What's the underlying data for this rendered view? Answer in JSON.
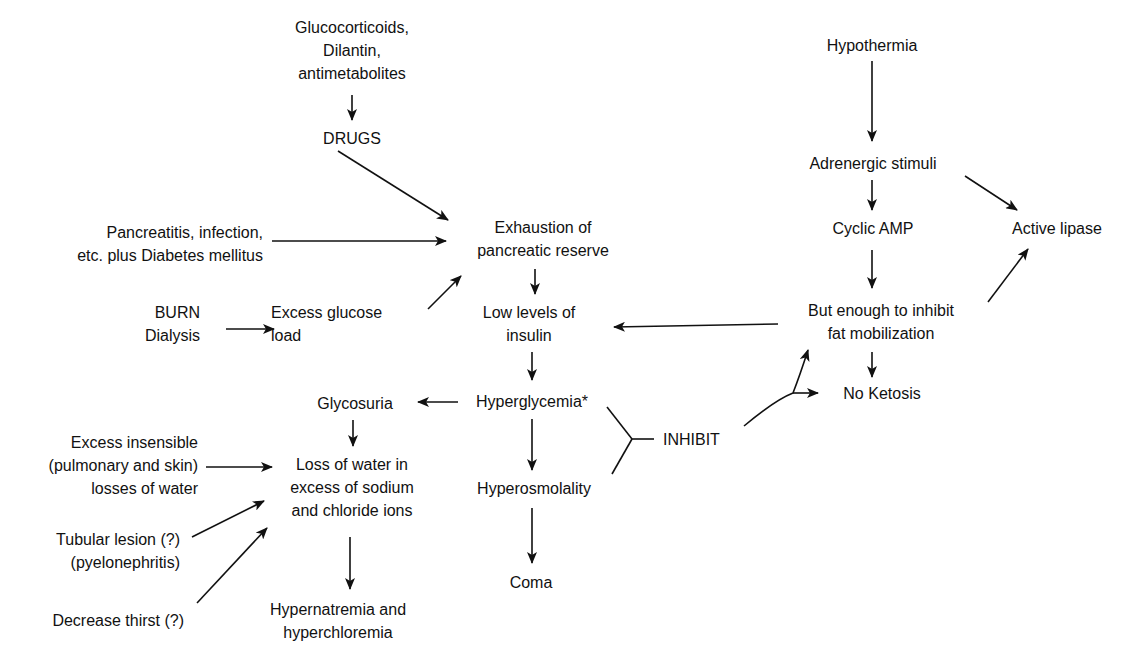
{
  "diagram": {
    "colors": {
      "ink": "#111111",
      "background": "#ffffff"
    },
    "nodes": [
      {
        "id": "drug_list",
        "align": "c",
        "x": 352,
        "y": 16,
        "lines": [
          "Glucocorticoids,",
          "Dilantin,",
          "antimetabolites"
        ]
      },
      {
        "id": "drugs",
        "align": "c",
        "x": 352,
        "y": 127,
        "lines": [
          "DRUGS"
        ]
      },
      {
        "id": "pancreatitis",
        "align": "r",
        "x": 263,
        "y": 221,
        "lines": [
          "Pancreatitis, infection,",
          "etc. plus Diabetes mellitus"
        ]
      },
      {
        "id": "exhaustion",
        "align": "c",
        "x": 543,
        "y": 216,
        "lines": [
          "Exhaustion of",
          "pancreatic reserve"
        ]
      },
      {
        "id": "burn",
        "align": "r",
        "x": 200,
        "y": 301,
        "lines": [
          "BURN",
          "Dialysis"
        ]
      },
      {
        "id": "excess_glucose",
        "align": "l",
        "x": 271,
        "y": 301,
        "lines": [
          "Excess glucose",
          "load"
        ]
      },
      {
        "id": "low_insulin",
        "align": "c",
        "x": 529,
        "y": 301,
        "lines": [
          "Low levels of",
          "insulin"
        ]
      },
      {
        "id": "glycosuria",
        "align": "c",
        "x": 355,
        "y": 392,
        "lines": [
          "Glycosuria"
        ]
      },
      {
        "id": "hyperglycemia",
        "align": "c",
        "x": 532,
        "y": 390,
        "lines": [
          "Hyperglycemia*"
        ]
      },
      {
        "id": "excess_insensible",
        "align": "r",
        "x": 198,
        "y": 431,
        "lines": [
          "Excess insensible",
          "(pulmonary and skin)",
          "losses of water"
        ]
      },
      {
        "id": "loss_water",
        "align": "c",
        "x": 352,
        "y": 453,
        "lines": [
          "Loss of water in",
          "excess of sodium",
          "and chloride ions"
        ]
      },
      {
        "id": "hyperosmolality",
        "align": "c",
        "x": 534,
        "y": 477,
        "lines": [
          "Hyperosmolality"
        ]
      },
      {
        "id": "tubular",
        "align": "r",
        "x": 180,
        "y": 528,
        "lines": [
          "Tubular lesion (?)",
          "(pyelonephritis)"
        ]
      },
      {
        "id": "coma",
        "align": "c",
        "x": 531,
        "y": 571,
        "lines": [
          "Coma"
        ]
      },
      {
        "id": "thirst",
        "align": "r",
        "x": 184,
        "y": 609,
        "lines": [
          "Decrease thirst (?)"
        ]
      },
      {
        "id": "hypernatremia",
        "align": "c",
        "x": 338,
        "y": 598,
        "lines": [
          "Hypernatremia and",
          "hyperchloremia"
        ]
      },
      {
        "id": "inhibit",
        "align": "l",
        "x": 663,
        "y": 428,
        "lines": [
          "INHIBIT"
        ]
      },
      {
        "id": "hypothermia",
        "align": "c",
        "x": 872,
        "y": 34,
        "lines": [
          "Hypothermia"
        ]
      },
      {
        "id": "adrenergic",
        "align": "c",
        "x": 873,
        "y": 152,
        "lines": [
          "Adrenergic stimuli"
        ]
      },
      {
        "id": "cyclic_amp",
        "align": "c",
        "x": 873,
        "y": 217,
        "lines": [
          "Cyclic AMP"
        ]
      },
      {
        "id": "active_lipase",
        "align": "c",
        "x": 1057,
        "y": 217,
        "lines": [
          "Active lipase"
        ]
      },
      {
        "id": "but_enough",
        "align": "c",
        "x": 881,
        "y": 299,
        "lines": [
          "But enough to inhibit",
          "fat mobilization"
        ]
      },
      {
        "id": "no_ketosis",
        "align": "c",
        "x": 882,
        "y": 382,
        "lines": [
          "No Ketosis"
        ]
      }
    ],
    "arrows": [
      {
        "from": "drug_list",
        "to": "drugs",
        "x1": 352,
        "y1": 95,
        "x2": 352,
        "y2": 120,
        "head": true
      },
      {
        "from": "drugs",
        "to": "exhaustion",
        "x1": 338,
        "y1": 151,
        "x2": 448,
        "y2": 220,
        "head": true
      },
      {
        "from": "pancreatitis",
        "to": "exhaustion",
        "x1": 272,
        "y1": 241,
        "x2": 446,
        "y2": 241,
        "head": true
      },
      {
        "from": "burn",
        "to": "excess_glucose",
        "x1": 226,
        "y1": 329,
        "x2": 274,
        "y2": 329,
        "head": true
      },
      {
        "from": "excess_glucose",
        "to": "exhaustion",
        "x1": 428,
        "y1": 309,
        "x2": 461,
        "y2": 276,
        "head": true
      },
      {
        "from": "exhaustion",
        "to": "low_insulin",
        "x1": 535,
        "y1": 269,
        "x2": 535,
        "y2": 294,
        "head": true
      },
      {
        "from": "but_enough",
        "to": "low_insulin",
        "x1": 778,
        "y1": 324,
        "x2": 614,
        "y2": 327,
        "head": true
      },
      {
        "from": "low_insulin",
        "to": "hyperglycemia",
        "x1": 532,
        "y1": 352,
        "x2": 532,
        "y2": 380,
        "head": true
      },
      {
        "from": "hyperglycemia",
        "to": "glycosuria",
        "x1": 458,
        "y1": 402,
        "x2": 418,
        "y2": 402,
        "head": true
      },
      {
        "from": "glycosuria",
        "to": "loss_water",
        "x1": 353,
        "y1": 420,
        "x2": 353,
        "y2": 446,
        "head": true
      },
      {
        "from": "hyperglycemia",
        "to": "hyperosmolality",
        "x1": 532,
        "y1": 419,
        "x2": 532,
        "y2": 470,
        "head": true
      },
      {
        "from": "excess_insensible",
        "to": "loss_water",
        "x1": 206,
        "y1": 467,
        "x2": 272,
        "y2": 467,
        "head": true
      },
      {
        "from": "tubular",
        "to": "loss_water",
        "x1": 192,
        "y1": 537,
        "x2": 264,
        "y2": 501,
        "head": true
      },
      {
        "from": "thirst",
        "to": "loss_water",
        "x1": 197,
        "y1": 603,
        "x2": 267,
        "y2": 528,
        "head": true
      },
      {
        "from": "loss_water",
        "to": "hypernatremia",
        "x1": 350,
        "y1": 537,
        "x2": 350,
        "y2": 589,
        "head": true
      },
      {
        "from": "hyperosmolality",
        "to": "coma",
        "x1": 532,
        "y1": 508,
        "x2": 532,
        "y2": 563,
        "head": true
      },
      {
        "from": "hypothermia",
        "to": "adrenergic",
        "x1": 872,
        "y1": 61,
        "x2": 872,
        "y2": 141,
        "head": true
      },
      {
        "from": "adrenergic",
        "to": "cyclic_amp",
        "x1": 872,
        "y1": 180,
        "x2": 872,
        "y2": 210,
        "head": true
      },
      {
        "from": "adrenergic",
        "to": "active_lipase",
        "x1": 965,
        "y1": 176,
        "x2": 1017,
        "y2": 210,
        "head": true
      },
      {
        "from": "cyclic_amp",
        "to": "but_enough",
        "x1": 872,
        "y1": 250,
        "x2": 872,
        "y2": 288,
        "head": true
      },
      {
        "from": "but_enough",
        "to": "active_lipase",
        "x1": 988,
        "y1": 302,
        "x2": 1028,
        "y2": 249,
        "head": true
      },
      {
        "from": "but_enough",
        "to": "no_ketosis",
        "x1": 872,
        "y1": 352,
        "x2": 872,
        "y2": 377,
        "head": true
      }
    ],
    "inhibit_bracket": {
      "upper": {
        "x1": 607,
        "y1": 407,
        "x2": 632,
        "y2": 439
      },
      "lower": {
        "x1": 612,
        "y1": 474,
        "x2": 632,
        "y2": 439
      },
      "stem": {
        "x1": 632,
        "y1": 439,
        "x2": 654,
        "y2": 439
      }
    },
    "inhibit_curve": {
      "path": "M 744 426 Q 775 400 793 393 Q 800 375 808 350",
      "branch_to_no_ketosis": {
        "x1": 793,
        "y1": 393,
        "x2": 818,
        "y2": 393
      },
      "head_up": {
        "x": 808,
        "y": 350
      }
    }
  }
}
